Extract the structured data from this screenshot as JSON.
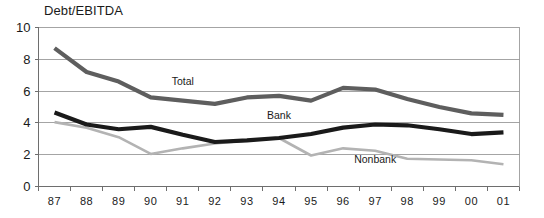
{
  "chart_data": {
    "type": "line",
    "title": "Debt/EBITDA",
    "xlabel": "",
    "ylabel": "",
    "ylim": [
      0,
      10
    ],
    "yticks": [
      0,
      2,
      4,
      6,
      8,
      10
    ],
    "ytick_labels": [
      "0",
      "2",
      "4",
      "6",
      "8",
      "10"
    ],
    "grid": true,
    "legend_position": "inline-annotations",
    "categories": [
      "87",
      "88",
      "89",
      "90",
      "91",
      "92",
      "93",
      "94",
      "95",
      "96",
      "97",
      "98",
      "99",
      "00",
      "01"
    ],
    "series": [
      {
        "name": "Total",
        "color": "#5e5e5e",
        "label": "Total",
        "values": [
          8.7,
          7.2,
          6.6,
          5.6,
          5.4,
          5.2,
          5.6,
          5.7,
          5.4,
          6.2,
          6.1,
          5.5,
          5.0,
          4.6,
          4.5
        ]
      },
      {
        "name": "Bank",
        "color": "#1a1a1a",
        "label": "Bank",
        "values": [
          4.65,
          3.9,
          3.6,
          3.75,
          3.25,
          2.8,
          2.9,
          3.05,
          3.3,
          3.7,
          3.9,
          3.85,
          3.6,
          3.3,
          3.4
        ]
      },
      {
        "name": "Nonbank",
        "color": "#b3b3b3",
        "label": "Nonbank",
        "values": [
          4.05,
          3.7,
          3.1,
          2.05,
          2.4,
          2.7,
          2.9,
          3.05,
          1.95,
          2.4,
          2.25,
          1.75,
          1.7,
          1.65,
          1.4
        ]
      }
    ],
    "annotations": [
      {
        "text": "Total",
        "x_category": "91",
        "y_value": 6.4
      },
      {
        "text": "Bank",
        "x_category": "94",
        "y_value": 4.25
      },
      {
        "text": "Nonbank",
        "x_category": "97",
        "y_value": 1.45
      }
    ]
  }
}
